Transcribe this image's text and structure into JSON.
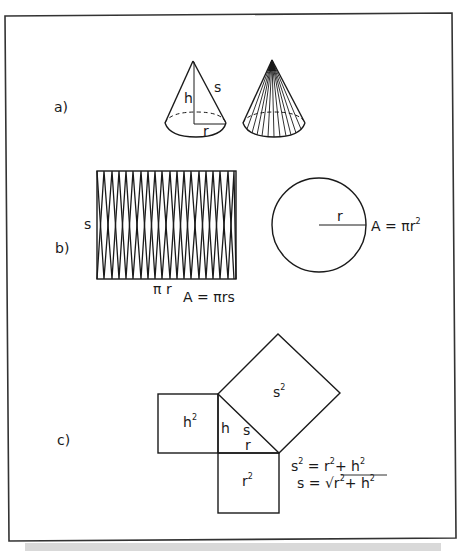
{
  "figure": {
    "parts": {
      "a": {
        "label": "a)",
        "cone_labels": {
          "height": "h",
          "slant": "s",
          "radius": "r"
        }
      },
      "b": {
        "label": "b)",
        "rect_side_label": "s",
        "rect_base_label": "π r",
        "rect_area": "A = πrs",
        "circle_radius_label": "r",
        "circle_area_prefix": "A = πr",
        "circle_area_exp": "2"
      },
      "c": {
        "label": "c)",
        "square_h": "h",
        "square_h_exp": "2",
        "square_s": "s",
        "square_s_exp": "2",
        "square_r": "r",
        "square_r_exp": "2",
        "tri_h": "h",
        "tri_s": "s",
        "tri_r": "r",
        "eq1": {
          "s": "s",
          "s_exp": "2",
          "eq": " = r",
          "r_exp": "2",
          "plus": "+ h",
          "h_exp": "2"
        },
        "eq2": {
          "prefix": "s = ",
          "radical": "√",
          "r": "r",
          "r_exp": "2",
          "plus": "+ h",
          "h_exp": "2"
        }
      }
    },
    "colors": {
      "ink": "#1a1a1a",
      "frame": "#333333",
      "shadow": "#d9d9d9"
    }
  }
}
